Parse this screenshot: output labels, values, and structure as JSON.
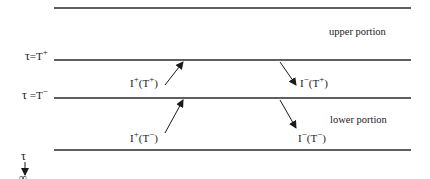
{
  "diagram": {
    "region_labels": {
      "upper": "upper portion",
      "lower": "lower portion"
    },
    "boundary_labels": {
      "upper_boundary": {
        "tau": "τ",
        "eq": "=T",
        "sign": "+"
      },
      "lower_boundary": {
        "tau": "τ",
        "eq": "=T",
        "sign": "−"
      }
    },
    "depth_axis": {
      "symbol": "τ",
      "end": "∞"
    },
    "intensities": [
      {
        "id": "up_at_Tplus",
        "base": "I",
        "dir": "+",
        "arg": "T",
        "arg_sign": "+"
      },
      {
        "id": "down_at_Tplus",
        "base": "I",
        "dir": "−",
        "arg": "T",
        "arg_sign": "+"
      },
      {
        "id": "up_at_Tminus",
        "base": "I",
        "dir": "+",
        "arg": "T",
        "arg_sign": "−"
      },
      {
        "id": "down_at_Tminus",
        "base": "I",
        "dir": "−",
        "arg": "T",
        "arg_sign": "−"
      }
    ],
    "colors": {
      "line": "#2a2a2a",
      "text": "#1a1a1a",
      "background": "#ffffff"
    }
  }
}
